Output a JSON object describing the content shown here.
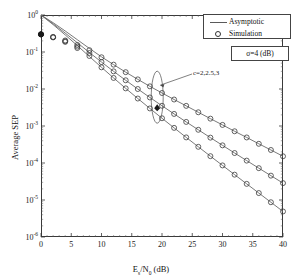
{
  "chart_data": {
    "type": "line",
    "title": "",
    "xlabel": "E_s/N_0 (dB)",
    "ylabel": "Average SEP",
    "xlim": [
      0,
      40
    ],
    "ylim": [
      1e-06,
      1
    ],
    "yscale": "log",
    "xticks": [
      0,
      5,
      10,
      15,
      20,
      25,
      30,
      35,
      40
    ],
    "ytick_labels": [
      "10^0",
      "10^-1",
      "10^-2",
      "10^-3",
      "10^-4",
      "10^-5",
      "10^-6"
    ],
    "grid": false,
    "legend_position": "top-right",
    "legend_entries": [
      "Asymptotic",
      "Simulation"
    ],
    "annotations": [
      {
        "text": "c=2,2.5,3",
        "x": 22,
        "y": 0.025
      },
      {
        "text": "σ=4 (dB)",
        "x": 33,
        "y": 0.35
      }
    ],
    "series": [
      {
        "name": "c=2 (Asymptotic)",
        "style": "line",
        "x": [
          0,
          2,
          4,
          6,
          8,
          10,
          12,
          14,
          16,
          18,
          20,
          22,
          24,
          26,
          28,
          30,
          32,
          34,
          36,
          38,
          40
        ],
        "y": [
          1.0,
          0.62,
          0.37,
          0.215,
          0.125,
          0.074,
          0.0455,
          0.0285,
          0.0182,
          0.0118,
          0.0078,
          0.0052,
          0.0035,
          0.00235,
          0.00158,
          0.00107,
          0.00072,
          0.00049,
          0.00033,
          0.000225,
          0.000152
        ]
      },
      {
        "name": "c=2.5 (Asymptotic)",
        "style": "line",
        "x": [
          0,
          2,
          4,
          6,
          8,
          10,
          12,
          14,
          16,
          18,
          20,
          22,
          24,
          26,
          28,
          30,
          32,
          34,
          36,
          38,
          40
        ],
        "y": [
          1.0,
          0.58,
          0.325,
          0.178,
          0.097,
          0.0535,
          0.03,
          0.0172,
          0.01,
          0.0059,
          0.00352,
          0.00212,
          0.00129,
          0.00079,
          0.000485,
          0.0003,
          0.000186,
          0.000116,
          7.25e-05,
          4.55e-05,
          2.86e-05
        ]
      },
      {
        "name": "c=3 (Asymptotic)",
        "style": "line",
        "x": [
          0,
          2,
          4,
          6,
          8,
          10,
          12,
          14,
          16,
          18,
          20,
          22,
          24,
          26,
          28,
          30,
          32,
          34,
          36,
          38,
          40
        ],
        "y": [
          1.0,
          0.55,
          0.29,
          0.149,
          0.0755,
          0.0385,
          0.0199,
          0.0104,
          0.00553,
          0.00298,
          0.00162,
          0.00089,
          0.000492,
          0.000274,
          0.000153,
          8.6e-05,
          4.84e-05,
          2.73e-05,
          1.54e-05,
          8.7e-06,
          4.9e-06
        ]
      },
      {
        "name": "c=2 (Simulation)",
        "style": "markers",
        "x": [
          0,
          2,
          4,
          6,
          8,
          10,
          12,
          14,
          16,
          18,
          20,
          22,
          24,
          26,
          28,
          30,
          32,
          34,
          36,
          38,
          40
        ],
        "y": [
          0.3,
          0.255,
          0.205,
          0.155,
          0.112,
          0.072,
          0.0455,
          0.0285,
          0.0182,
          0.0118,
          0.0078,
          0.0052,
          0.0035,
          0.00235,
          0.00158,
          0.00107,
          0.00072,
          0.00049,
          0.00033,
          0.000225,
          0.000152
        ]
      },
      {
        "name": "c=2.5 (Simulation)",
        "style": "markers",
        "x": [
          0,
          2,
          4,
          6,
          8,
          10,
          12,
          14,
          16,
          18,
          20,
          22,
          24,
          26,
          28,
          30,
          32,
          34,
          36,
          38,
          40
        ],
        "y": [
          0.3,
          0.252,
          0.195,
          0.14,
          0.094,
          0.0535,
          0.03,
          0.0172,
          0.01,
          0.0059,
          0.00352,
          0.00212,
          0.00129,
          0.00079,
          0.000485,
          0.0003,
          0.000186,
          0.000116,
          7.25e-05,
          4.55e-05,
          2.86e-05
        ]
      },
      {
        "name": "c=3 (Simulation)",
        "style": "markers",
        "x": [
          0,
          2,
          4,
          6,
          8,
          10,
          12,
          14,
          16,
          18,
          20,
          22,
          24,
          26,
          28,
          30,
          32,
          34,
          36,
          38,
          40
        ],
        "y": [
          0.3,
          0.248,
          0.188,
          0.128,
          0.078,
          0.0385,
          0.0199,
          0.0104,
          0.00553,
          0.00298,
          0.00162,
          0.00089,
          0.000492,
          0.000274,
          0.000153,
          8.6e-05,
          4.84e-05,
          2.73e-05,
          1.54e-05,
          8.7e-06,
          4.9e-06
        ]
      }
    ]
  },
  "axes": {
    "x_label_main": "E",
    "x_label_sub1": "s",
    "x_label_mid": "/N",
    "x_label_sub2": "0",
    "x_label_unit": " (dB)",
    "y_label": "Average SEP",
    "xticks": [
      "0",
      "5",
      "10",
      "15",
      "20",
      "25",
      "30",
      "35",
      "40"
    ],
    "ytick_mantissa": "10",
    "ytick_exponents": [
      "0",
      "-1",
      "-2",
      "-3",
      "-4",
      "-5",
      "-6"
    ]
  },
  "legend": {
    "asymptotic_label": "Asymptotic",
    "simulation_label": "Simulation"
  },
  "sigma_box": {
    "text": "σ=4 (dB)"
  },
  "callout": {
    "text": "c=2,2.5,3"
  },
  "colors": {
    "curve": "#6a6a6a",
    "marker": "#3c3c3c",
    "axis": "#3a3a3a",
    "text": "#1a1a1a",
    "background": "#ffffff"
  }
}
